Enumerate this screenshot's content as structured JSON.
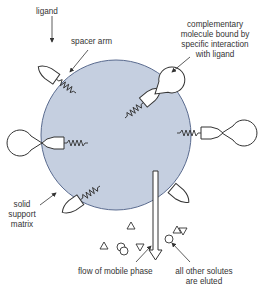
{
  "colors": {
    "matrix_fill": "#c5cfe0",
    "matrix_stroke": "#5a6b8f",
    "line": "#333333",
    "text": "#333333"
  },
  "labels": {
    "ligand": "ligand",
    "spacer_arm": "spacer arm",
    "complementary": [
      "complementary",
      "molecule bound by",
      "specific interaction",
      "with ligand"
    ],
    "solid_support": [
      "solid",
      "support",
      "matrix"
    ],
    "flow": "flow of mobile phase",
    "eluted": [
      "all other solutes",
      "are eluted"
    ]
  },
  "elements": {
    "matrix": "solid-support-bead",
    "ligand_count": 6,
    "bound_molecule_count": 3,
    "free_solute_shapes": [
      "triangle",
      "triangle",
      "circle",
      "circle",
      "inverted-triangle",
      "triangle",
      "inverted-triangle",
      "circle"
    ]
  }
}
